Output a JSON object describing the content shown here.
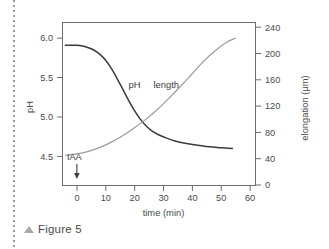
{
  "figure": {
    "caption": "Figure 5",
    "caption_marker": "triangle-up-icon"
  },
  "chart_data": {
    "type": "line",
    "title": "",
    "xlabel": "time (min)",
    "ylabel": "pH",
    "y2label": "elongation (µm)",
    "xlim": [
      -5,
      62
    ],
    "ylim": [
      4.28,
      6.22
    ],
    "y2lim": [
      0,
      248
    ],
    "xticks": [
      0,
      10,
      20,
      30,
      40,
      50,
      60
    ],
    "xtick_labels": [
      "0",
      "10",
      "20",
      "30",
      "40",
      "50",
      "60"
    ],
    "yticks": [
      4.5,
      5.0,
      5.5,
      6.0
    ],
    "ytick_labels": [
      "4.5",
      "5.0",
      "5.5",
      "6.0"
    ],
    "y2ticks": [
      0,
      40,
      80,
      120,
      160,
      200,
      240
    ],
    "y2tick_labels": [
      "0",
      "40",
      "80",
      "120",
      "160",
      "200",
      "240"
    ],
    "grid": false,
    "legend": "inline-labels",
    "series": [
      {
        "name": "pH",
        "axis": "left",
        "color": "#3a3a3a",
        "label_x": 20,
        "label_y": 5.44,
        "x": [
          -4,
          -2,
          0,
          2,
          4,
          6,
          8,
          10,
          12,
          14,
          16,
          18,
          20,
          22,
          24,
          26,
          28,
          30,
          34,
          38,
          42,
          46,
          50,
          54
        ],
        "y": [
          5.95,
          5.95,
          5.95,
          5.94,
          5.92,
          5.89,
          5.84,
          5.77,
          5.67,
          5.55,
          5.42,
          5.29,
          5.17,
          5.07,
          4.99,
          4.93,
          4.89,
          4.86,
          4.81,
          4.78,
          4.76,
          4.74,
          4.73,
          4.72
        ]
      },
      {
        "name": "length",
        "axis": "right",
        "color": "#9b9b9b",
        "label_x": 31,
        "label_y": 5.44,
        "x": [
          -4,
          0,
          4,
          8,
          12,
          16,
          20,
          24,
          28,
          32,
          36,
          40,
          44,
          48,
          52,
          55
        ],
        "y": [
          46,
          48,
          52,
          58,
          66,
          76,
          88,
          101,
          116,
          133,
          151,
          170,
          189,
          205,
          218,
          224
        ]
      }
    ],
    "annotations": [
      {
        "name": "iaa-marker",
        "text": "IAA",
        "x": 0,
        "arrow": "down-arrow-icon"
      }
    ]
  }
}
